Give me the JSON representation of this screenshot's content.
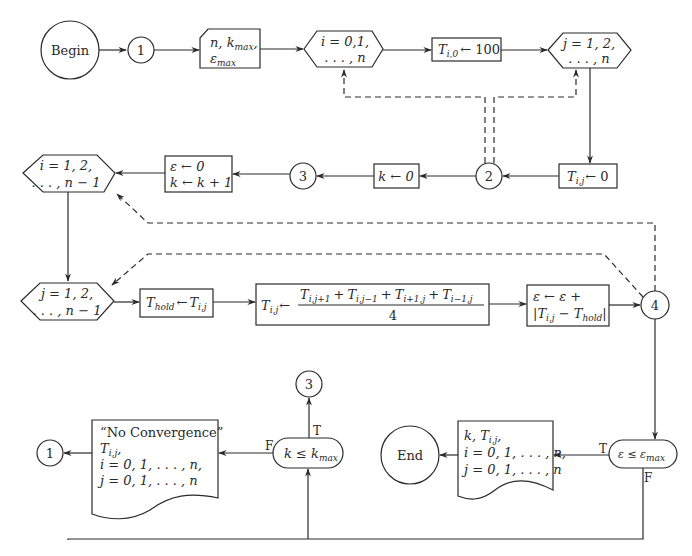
{
  "diagram": {
    "title_fragment": "Flow diagram",
    "nodes": {
      "begin": {
        "label": "Begin",
        "shape": "terminal-circle"
      },
      "connector_1_top": {
        "label": "1",
        "shape": "connector"
      },
      "input": {
        "line1": "n, k",
        "line1_sub": "max",
        "line2": "ε",
        "line2_sub": "max",
        "shape": "manual-input"
      },
      "loop_i_outer": {
        "line1": "i = 0,1,",
        "line2": ". . . , n",
        "shape": "loop-hexagon"
      },
      "init_boundary": {
        "lhs": "T",
        "lhs_sub": "i,0",
        "rhs": "← 100",
        "shape": "process"
      },
      "loop_j_outer": {
        "line1": "j = 1, 2,",
        "line2": ". . . , n",
        "shape": "loop-hexagon"
      },
      "init_interior": {
        "lhs": "T",
        "lhs_sub": "i,j",
        "rhs": "← 0",
        "shape": "process"
      },
      "connector_2": {
        "label": "2",
        "shape": "connector"
      },
      "init_k": {
        "text": "k ← 0",
        "shape": "process"
      },
      "connector_3_mid": {
        "label": "3",
        "shape": "connector"
      },
      "reset_eps": {
        "line1": "ε ← 0",
        "line2": "k ← k + 1",
        "shape": "process"
      },
      "loop_i_inner": {
        "line1": "i = 1, 2,",
        "line2": ". . . , n − 1",
        "shape": "loop-hexagon"
      },
      "loop_j_inner": {
        "line1": "j = 1, 2,",
        "line2": ". . . , n − 1",
        "shape": "loop-hexagon"
      },
      "hold": {
        "lhs": "T",
        "lhs_sub": "hold",
        "mid": "←",
        "rhs": "T",
        "rhs_sub": "i,j",
        "shape": "process"
      },
      "update": {
        "lhs": "T",
        "lhs_sub": "i,j",
        "arrow": "←",
        "numerator_terms": [
          {
            "t": "T",
            "sub": "i,j+1"
          },
          {
            "t": "T",
            "sub": "i,j−1"
          },
          {
            "t": "T",
            "sub": "i+1,j"
          },
          {
            "t": "T",
            "sub": "i−1,j"
          }
        ],
        "plus": "+",
        "denominator": "4",
        "shape": "process"
      },
      "accumulate": {
        "line1": "ε ← ε +",
        "line2_open": "|T",
        "line2_sub1": "i,j",
        "line2_mid": " − T",
        "line2_sub2": "hold",
        "line2_close": "|",
        "shape": "process"
      },
      "connector_4": {
        "label": "4",
        "shape": "connector"
      },
      "decision_eps": {
        "text": "ε ≤ ε",
        "sub": "max",
        "true_label": "T",
        "false_label": "F",
        "shape": "decision"
      },
      "output_converged": {
        "line1": "k, T",
        "line1_sub": "i,j",
        "line1_end": ",",
        "line2": "i = 0, 1, . . . , n,",
        "line3": "j = 0, 1, . . . , n",
        "shape": "document"
      },
      "end": {
        "label": "End",
        "shape": "terminal-circle"
      },
      "decision_k": {
        "text": "k ≤ k",
        "sub": "max",
        "true_label": "T",
        "false_label": "F",
        "shape": "decision"
      },
      "connector_3_bottom": {
        "label": "3",
        "shape": "connector"
      },
      "output_no_conv": {
        "line1": "“No Convergence”",
        "line2": "T",
        "line2_sub": "i,j",
        "line2_end": ",",
        "line3": "i = 0, 1, . . . , n,",
        "line4": "j = 0, 1, . . . , n",
        "shape": "document"
      },
      "connector_1_bottom": {
        "label": "1",
        "shape": "connector"
      }
    },
    "colors": {
      "stroke": "#2a2a2a",
      "background": "#ffffff"
    }
  }
}
